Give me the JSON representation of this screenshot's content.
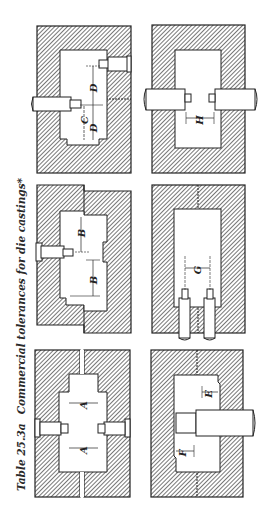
{
  "caption": {
    "table_number": "Table 25.3a",
    "title": "Commercial tolerances for die castings*"
  },
  "colors": {
    "ink": "#222222",
    "hatch": "#555555",
    "paper": "#ffffff"
  },
  "figures": [
    {
      "id": "fig-C-D",
      "dimension_labels": [
        "C",
        "D",
        "D"
      ],
      "description": "Die with two opposing core pins at different heights; dimensions C and D"
    },
    {
      "id": "fig-H",
      "dimension_labels": [
        "H"
      ],
      "description": "Die with two opposing round core pins; dimension H between pin tips"
    },
    {
      "id": "fig-B",
      "dimension_labels": [
        "B",
        "B"
      ],
      "description": "Offset die halves with single side pin; dimensions B"
    },
    {
      "id": "fig-G",
      "dimension_labels": [
        "G"
      ],
      "description": "Die with two parallel pins entering from bottom; dimension G"
    },
    {
      "id": "fig-A",
      "dimension_labels": [
        "A",
        "A"
      ],
      "description": "Split die with two opposing pins; dimensions A"
    },
    {
      "id": "fig-E-F",
      "dimension_labels": [
        "E",
        "F"
      ],
      "description": "Die with single large round core; dimensions E and F"
    }
  ],
  "labels": {
    "C": "C",
    "D": "D",
    "H": "H",
    "B": "B",
    "G": "G",
    "A": "A",
    "E": "E",
    "F": "F"
  }
}
